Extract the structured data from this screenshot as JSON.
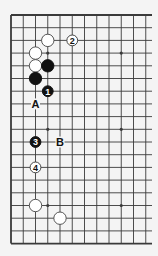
{
  "diagram": {
    "type": "go-board-partial",
    "grid": {
      "origin_x": 11,
      "origin_y": 15,
      "spacing_x": 12.25,
      "spacing_y": 12.7,
      "visible_columns": 12,
      "rows": 19,
      "right_extent_x": 152,
      "edges": [
        "top",
        "left",
        "bottom"
      ]
    },
    "colors": {
      "background": "#f4f4f4",
      "line": "#3a3a3a",
      "black_stone": "#111111",
      "white_stone": "#ffffff",
      "white_stone_border": "#444444"
    },
    "star_points": [
      {
        "col": 3,
        "row": 3
      },
      {
        "col": 9,
        "row": 3
      },
      {
        "col": 3,
        "row": 9
      },
      {
        "col": 9,
        "row": 9
      },
      {
        "col": 3,
        "row": 15
      },
      {
        "col": 9,
        "row": 15
      }
    ],
    "stones": [
      {
        "color": "white",
        "col": 3,
        "row": 2,
        "label": ""
      },
      {
        "color": "white",
        "col": 2,
        "row": 3,
        "label": ""
      },
      {
        "color": "white",
        "col": 2,
        "row": 4,
        "label": ""
      },
      {
        "color": "black",
        "col": 3,
        "row": 4,
        "label": ""
      },
      {
        "color": "black",
        "col": 2,
        "row": 5,
        "label": ""
      },
      {
        "color": "white",
        "col": 2,
        "row": 15,
        "label": ""
      },
      {
        "color": "white",
        "col": 4,
        "row": 16,
        "label": ""
      }
    ],
    "moves": [
      {
        "number": "1",
        "color": "black",
        "col": 3,
        "row": 6
      },
      {
        "number": "2",
        "color": "white",
        "col": 5,
        "row": 2
      },
      {
        "number": "3",
        "color": "black",
        "col": 2,
        "row": 10
      },
      {
        "number": "4",
        "color": "white",
        "col": 2,
        "row": 12
      }
    ],
    "letter_marks": [
      {
        "label": "A",
        "col": 2,
        "row": 7
      },
      {
        "label": "B",
        "col": 4,
        "row": 10
      }
    ]
  }
}
